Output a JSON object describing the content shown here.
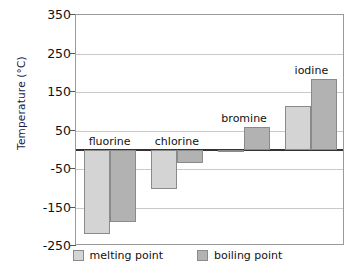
{
  "chart_data": {
    "type": "bar",
    "title": "",
    "xlabel": "",
    "ylabel": "Temperature (°C)",
    "ylim": [
      -250,
      350
    ],
    "yticks": [
      350,
      250,
      150,
      50,
      -50,
      -150,
      -250
    ],
    "grid": true,
    "zero_line": true,
    "legend_position": "bottom",
    "categories": [
      "fluorine",
      "chlorine",
      "bromine",
      "iodine"
    ],
    "series": [
      {
        "name": "melting point",
        "color": "#d4d4d4",
        "values": [
          -220,
          -101,
          -7,
          114
        ]
      },
      {
        "name": "boiling point",
        "color": "#b2b2b2",
        "values": [
          -188,
          -34,
          59,
          184
        ]
      }
    ]
  },
  "axis": {
    "y_title": "Temperature (°C)",
    "tick_labels": [
      "350",
      "250",
      "150",
      "50",
      "-50",
      "-150",
      "-250"
    ]
  },
  "groups": [
    {
      "label": "fluorine"
    },
    {
      "label": "chlorine"
    },
    {
      "label": "bromine"
    },
    {
      "label": "iodine"
    }
  ],
  "legend": {
    "items": [
      {
        "label": "melting point",
        "swatch": "melting-swatch"
      },
      {
        "label": "boiling point",
        "swatch": "boiling-swatch"
      }
    ]
  },
  "colors": {
    "melting": "#d4d4d4",
    "boiling": "#b2b2b2",
    "grid": "#c9c9c9",
    "axis": "#555555",
    "zero": "#333333",
    "y_title": "#1b1b4a"
  }
}
